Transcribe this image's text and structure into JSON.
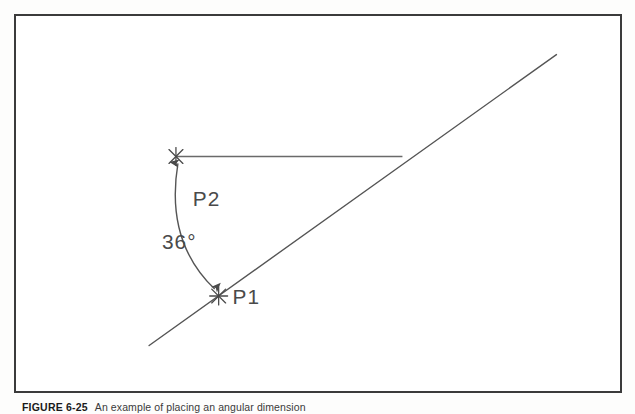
{
  "figure": {
    "caption_label": "FIGURE 6-25",
    "caption_text": "An example of placing an angular dimension",
    "panel_border_color": "#3b3b3b",
    "background_color": "#ffffff",
    "line_color": "#4a4a4a"
  },
  "diagram": {
    "type": "cad-angle-dimension",
    "angle_label": "36°",
    "point_labels": {
      "p1": "P1",
      "p2": "P2"
    },
    "points": {
      "p1": {
        "name": "P1",
        "x": 204,
        "y": 283,
        "marker": "blip-cross"
      },
      "p2": {
        "name": "P2",
        "x": 161,
        "y": 142,
        "marker": "blip-cross"
      }
    },
    "diagonal_line": {
      "name": "angled-line",
      "x1": 134,
      "y1": 333,
      "x2": 544,
      "y2": 39
    },
    "horizontal_line": {
      "name": "horizontal-reference-line",
      "x1": 161,
      "y1": 142,
      "x2": 389,
      "y2": 142
    },
    "angle_arc": {
      "name": "angle-dimension-arc",
      "start_x": 161,
      "start_y": 142,
      "end_x": 204,
      "end_y": 283,
      "control_x": 150,
      "control_y": 228,
      "arrowheads": "both",
      "value_degrees": 36
    },
    "angle_text_position": {
      "x": 149,
      "y": 226
    },
    "p2_text_position": {
      "x": 178,
      "y": 184
    },
    "p1_text_position": {
      "x": 216,
      "y": 289
    }
  }
}
